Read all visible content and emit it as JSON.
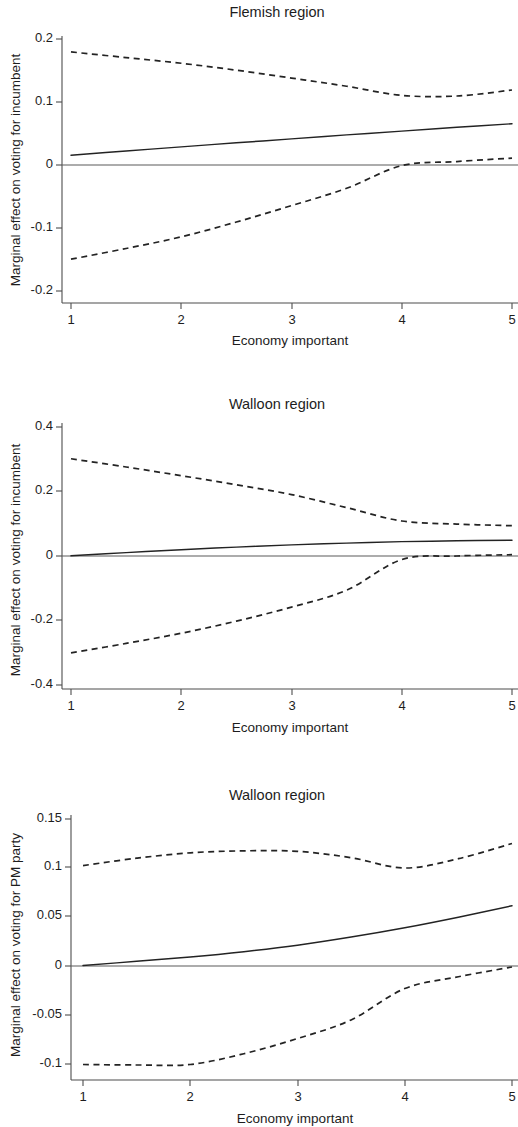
{
  "figure": {
    "background_color": "#ffffff",
    "line_color": "#232323",
    "axis_color": "#4d4d4d",
    "panel_count": 3
  },
  "panels": [
    {
      "id": "flemish-incumbent",
      "title": "Flemish region",
      "xlabel": "Economy important",
      "ylabel": "Marginal effect on voting for incumbent"
    },
    {
      "id": "walloon-incumbent",
      "title": "Walloon region",
      "xlabel": "Economy important",
      "ylabel": "Marginal effect on voting for incumbent"
    },
    {
      "id": "walloon-pm-party",
      "title": "Walloon region",
      "xlabel": "Economy important",
      "ylabel": "Marginal effect on voting for PM party"
    }
  ],
  "chart_data": [
    {
      "type": "line",
      "title": "Flemish region",
      "xlabel": "Economy important",
      "ylabel": "Marginal effect on voting for incumbent",
      "xlim": [
        1,
        5
      ],
      "ylim": [
        -0.2,
        0.2
      ],
      "xticks": [
        1,
        2,
        3,
        4,
        5
      ],
      "xticklabels": [
        "1",
        "2",
        "3",
        "4",
        "5"
      ],
      "yticks": [
        -0.2,
        -0.1,
        0,
        0.1,
        0.2
      ],
      "yticklabels": [
        "-0.2",
        "-0.1",
        "0",
        "0.1",
        "0.2"
      ],
      "grid": false,
      "legend": "none",
      "reference_line_y": 0,
      "x": [
        1,
        1.5,
        2,
        2.5,
        3,
        3.5,
        4,
        4.5,
        5
      ],
      "series": [
        {
          "name": "Marginal effect",
          "style": "solid",
          "values": [
            0.0155,
            0.0222,
            0.0288,
            0.0352,
            0.0415,
            0.0478,
            0.0538,
            0.0598,
            0.0655
          ]
        },
        {
          "name": "Upper 95% confidence bound",
          "style": "dashed",
          "values": [
            0.1795,
            0.1705,
            0.1615,
            0.1505,
            0.138,
            0.125,
            0.1105,
            0.1095,
            0.119
          ]
        },
        {
          "name": "Lower 95% confidence bound",
          "style": "dashed",
          "values": [
            -0.1495,
            -0.1325,
            -0.114,
            -0.0905,
            -0.0645,
            -0.037,
            -0.001,
            0.0055,
            0.011
          ]
        }
      ]
    },
    {
      "type": "line",
      "title": "Walloon region",
      "xlabel": "Economy important",
      "ylabel": "Marginal effect on voting for incumbent",
      "xlim": [
        1,
        5
      ],
      "ylim": [
        -0.4,
        0.4
      ],
      "xticks": [
        1,
        2,
        3,
        4,
        5
      ],
      "xticklabels": [
        "1",
        "2",
        "3",
        "4",
        "5"
      ],
      "yticks": [
        -0.4,
        -0.2,
        0,
        0.2,
        0.4
      ],
      "yticklabels": [
        "-0.4",
        "-0.2",
        "0",
        "0.2",
        "0.4"
      ],
      "grid": false,
      "legend": "none",
      "reference_line_y": 0,
      "x": [
        1,
        1.5,
        2,
        2.5,
        3,
        3.5,
        4,
        4.5,
        5
      ],
      "series": [
        {
          "name": "Marginal effect",
          "style": "solid",
          "values": [
            0.0005,
            0.0105,
            0.0195,
            0.0275,
            0.0345,
            0.04,
            0.0445,
            0.047,
            0.049
          ]
        },
        {
          "name": "Upper 95% confidence bound",
          "style": "dashed",
          "values": [
            0.3015,
            0.276,
            0.249,
            0.221,
            0.1905,
            0.15,
            0.1085,
            0.099,
            0.094
          ]
        },
        {
          "name": "Lower 95% confidence bound",
          "style": "dashed",
          "values": [
            -0.3005,
            -0.271,
            -0.2395,
            -0.202,
            -0.1585,
            -0.106,
            -0.011,
            0.0,
            0.004
          ]
        }
      ]
    },
    {
      "type": "line",
      "title": "Walloon region",
      "xlabel": "Economy important",
      "ylabel": "Marginal effect on voting for PM party",
      "xlim": [
        1,
        5
      ],
      "ylim": [
        -0.1,
        0.15
      ],
      "xticks": [
        1,
        2,
        3,
        4,
        5
      ],
      "xticklabels": [
        "1",
        "2",
        "3",
        "4",
        "5"
      ],
      "yticks": [
        -0.1,
        -0.05,
        0,
        0.05,
        0.1,
        0.15
      ],
      "yticklabels": [
        "-0.1",
        "-0.05",
        "0",
        "0.05",
        "0.1",
        "0.15"
      ],
      "grid": false,
      "legend": "none",
      "reference_line_y": 0,
      "x": [
        1,
        1.5,
        2,
        2.5,
        3,
        3.5,
        4,
        4.5,
        5
      ],
      "series": [
        {
          "name": "Marginal effect",
          "style": "solid",
          "values": [
            0.0005,
            0.0048,
            0.0092,
            0.0146,
            0.0212,
            0.0295,
            0.039,
            0.0498,
            0.0615
          ]
        },
        {
          "name": "Upper 95% confidence bound",
          "style": "dashed",
          "values": [
            0.1025,
            0.11,
            0.1155,
            0.1175,
            0.117,
            0.1105,
            0.1,
            0.1095,
            0.125
          ]
        },
        {
          "name": "Lower 95% confidence bound",
          "style": "dashed",
          "values": [
            -0.1005,
            -0.101,
            -0.1005,
            -0.0895,
            -0.074,
            -0.055,
            -0.023,
            -0.011,
            -0.001
          ]
        }
      ]
    }
  ]
}
